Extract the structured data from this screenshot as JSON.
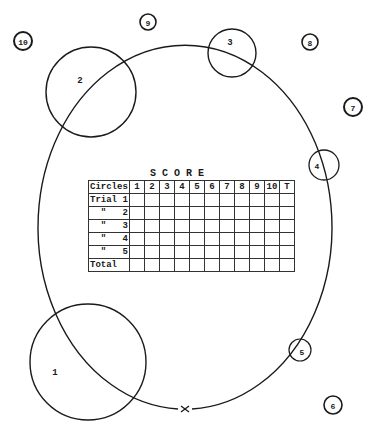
{
  "diagram": {
    "title": "SCORE",
    "circles": [
      {
        "label": "1",
        "size": "large",
        "on_path": true
      },
      {
        "label": "2",
        "size": "large",
        "on_path": true
      },
      {
        "label": "3",
        "size": "medium",
        "on_path": true
      },
      {
        "label": "4",
        "size": "small",
        "on_path": true
      },
      {
        "label": "5",
        "size": "small",
        "on_path": true
      },
      {
        "label": "6",
        "size": "tiny",
        "on_path": false
      },
      {
        "label": "7",
        "size": "tiny",
        "on_path": false
      },
      {
        "label": "8",
        "size": "tiny",
        "on_path": false
      },
      {
        "label": "9",
        "size": "tiny",
        "on_path": false
      },
      {
        "label": "10",
        "size": "tiny",
        "on_path": false
      }
    ],
    "start_marker": "x-marker",
    "path": "oval-track"
  },
  "score_table": {
    "corner_label": "Circles",
    "columns": [
      "1",
      "2",
      "3",
      "4",
      "5",
      "6",
      "7",
      "8",
      "9",
      "10",
      "T"
    ],
    "rows": [
      "Trial 1",
      "  \"   2",
      "  \"   3",
      "  \"   4",
      "  \"   5",
      "Total"
    ]
  },
  "colors": {
    "ink": "#1a1a1a",
    "paper": "#ffffff"
  }
}
